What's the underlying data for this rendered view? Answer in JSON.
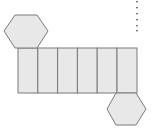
{
  "diagram": {
    "type": "net-of-hexagonal-prism",
    "colors": {
      "fill": "#e8e8e8",
      "stroke": "#7a7a7a",
      "dots": "#666666"
    },
    "top_hexagon": {
      "points": "15,15 37,15 48,31 37,48 15,48 4,31"
    },
    "bottom_hexagon": {
      "points": "116,93 136,93 146,109 136,125 116,125 107,109"
    },
    "faces": [
      {
        "x": 18,
        "w": 19.8
      },
      {
        "x": 37.8,
        "w": 19.8
      },
      {
        "x": 57.6,
        "w": 19.8
      },
      {
        "x": 77.4,
        "w": 19.8
      },
      {
        "x": 97.2,
        "w": 19.8
      },
      {
        "x": 117,
        "w": 20
      }
    ],
    "strip": {
      "y": 48,
      "h": 45
    },
    "dotted_line": {
      "x": 137,
      "dots_y": [
        2,
        8,
        14,
        20,
        26,
        31
      ]
    }
  }
}
